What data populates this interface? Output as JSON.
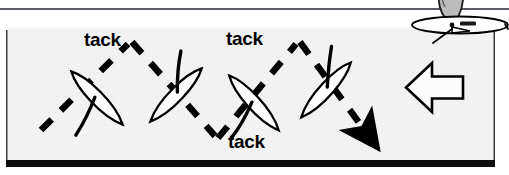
{
  "page": {
    "background_color": "#ffffff",
    "width": 509,
    "height": 175
  },
  "top_rule": {
    "name": "horizontal-rule",
    "color": "#5a5e64"
  },
  "diagram": {
    "panel": {
      "fill": "#f2f2f2",
      "border_color": "#3a3a3a",
      "bottom_border_color": "#000000",
      "x": 6,
      "y": 27,
      "width": 489,
      "height": 140
    },
    "wind_arrow": {
      "name": "wind-direction-arrow",
      "direction": "left",
      "fill": "#fbfbfb",
      "stroke": "#000000"
    },
    "course_path": {
      "style": "dashed",
      "color": "#000000",
      "end_marker": "solid-arrowhead"
    },
    "labels": [
      {
        "id": "tack-1",
        "text": "tack"
      },
      {
        "id": "tack-2",
        "text": "tack"
      },
      {
        "id": "tack-3",
        "text": "tack"
      }
    ],
    "boats": [
      {
        "id": "boat-1",
        "heading": "up-right",
        "hull_fill": "#ffffff",
        "outline": "#000000"
      },
      {
        "id": "boat-2",
        "heading": "down-right",
        "hull_fill": "#ffffff",
        "outline": "#000000"
      },
      {
        "id": "boat-3",
        "heading": "up-right",
        "hull_fill": "#ffffff",
        "outline": "#000000"
      },
      {
        "id": "boat-4",
        "heading": "down-right",
        "hull_fill": "#ffffff",
        "outline": "#000000"
      }
    ],
    "inset_boat": {
      "name": "overhead-sailboat-inset",
      "sail_fill": "#b9b9b9",
      "hull_fill": "#ffffff",
      "outline": "#000000"
    }
  }
}
